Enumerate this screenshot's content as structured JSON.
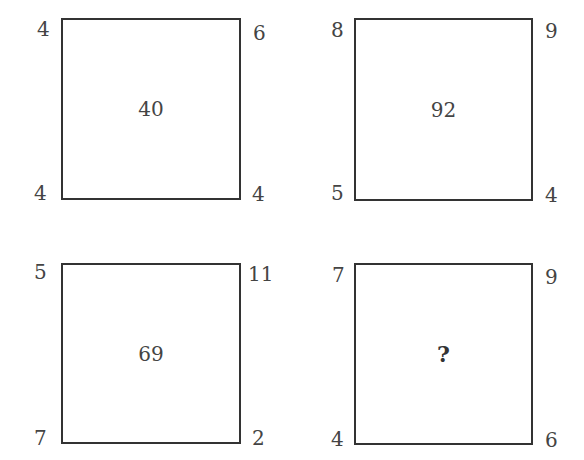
{
  "puzzle": {
    "squares": [
      {
        "center": "40",
        "top_left": "4",
        "top_right": "6",
        "bottom_left": "4",
        "bottom_right": "4"
      },
      {
        "center": "92",
        "top_left": "8",
        "top_right": "9",
        "bottom_left": "5",
        "bottom_right": "4"
      },
      {
        "center": "69",
        "top_left": "5",
        "top_right": "11",
        "bottom_left": "7",
        "bottom_right": "2"
      },
      {
        "center": "?",
        "top_left": "7",
        "top_right": "9",
        "bottom_left": "4",
        "bottom_right": "6"
      }
    ]
  }
}
